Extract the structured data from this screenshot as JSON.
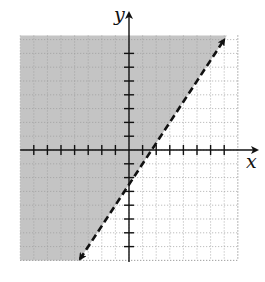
{
  "chart_data": {
    "type": "line",
    "title": "",
    "xlabel": "x",
    "ylabel": "y",
    "xlim": [
      -8,
      8
    ],
    "ylim": [
      -8,
      8.3
    ],
    "grid": true,
    "grid_style": "dotted",
    "x_ticks": [
      -7,
      -6,
      -5,
      -4,
      -3,
      -2,
      -1,
      1,
      2,
      3,
      4,
      5,
      6,
      7
    ],
    "y_ticks": [
      -7,
      -6,
      -5,
      -4,
      -3,
      -2,
      -1,
      1,
      2,
      3,
      4,
      5,
      6,
      7
    ],
    "tick_labels_shown": false,
    "boundary_line": {
      "equation": "y = 1.5x - 2.5",
      "slope": 1.5,
      "intercept": -2.5,
      "style": "dashed",
      "arrows": "both",
      "endpoints": [
        [
          -3.6,
          -7.9
        ],
        [
          7.0,
          8.0
        ]
      ]
    },
    "shaded_region": {
      "inequality": "y > 1.5x - 2.5",
      "side": "above-left",
      "color": "#c4c4c4"
    },
    "legend": null
  },
  "colors": {
    "shade": "#c4c4c4",
    "grid": "#9a9a9a",
    "axis": "#111111",
    "line": "#111111"
  }
}
